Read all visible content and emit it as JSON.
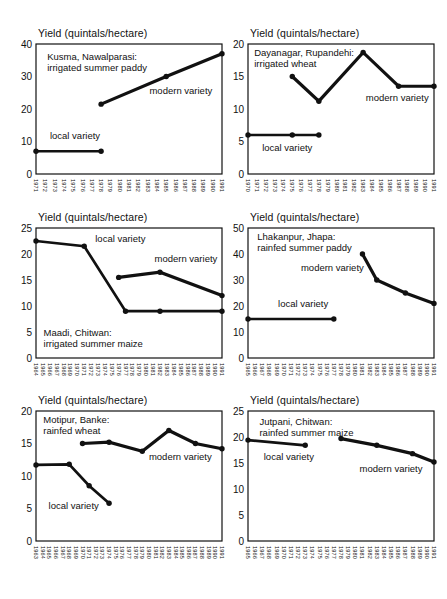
{
  "figure": {
    "background": "#ffffff",
    "ink": "#111111",
    "description_labels": {
      "local": "local variety",
      "modern": "modern variety"
    }
  },
  "chart_data": [
    {
      "type": "line",
      "title": "Yield (quintals/hectare)",
      "location_label": {
        "lines": [
          "Kusma, Nawalparasi:",
          "irrigated summer paddy"
        ],
        "x": 1972.2,
        "y": 35
      },
      "x_ticks": [
        1971,
        1972,
        1973,
        1974,
        1975,
        1976,
        1977,
        1978,
        1979,
        1980,
        1981,
        1982,
        1983,
        1984,
        1985,
        1986,
        1987,
        1988,
        1989,
        1990,
        1991
      ],
      "ylim": [
        0,
        40
      ],
      "y_ticks": [
        0,
        10,
        20,
        30,
        40
      ],
      "grid": false,
      "series": [
        {
          "name": "local variety",
          "points": [
            [
              1971,
              7
            ],
            [
              1978,
              7
            ]
          ],
          "label": {
            "text": "local variety",
            "x": 1972.5,
            "y": 10.8
          }
        },
        {
          "name": "modern variety",
          "points": [
            [
              1978,
              21.5
            ],
            [
              1985,
              30
            ],
            [
              1991,
              37
            ]
          ],
          "label": {
            "text": "modern variety",
            "x": 1983.2,
            "y": 24.5
          }
        }
      ]
    },
    {
      "type": "line",
      "title": "Yield (quintals/hectare)",
      "location_label": {
        "lines": [
          "Dayanagar, Rupandehi:",
          "irrigated wheat"
        ],
        "x": 1970.7,
        "y": 18.2
      },
      "x_ticks": [
        1970,
        1971,
        1972,
        1973,
        1974,
        1975,
        1976,
        1977,
        1978,
        1979,
        1980,
        1981,
        1982,
        1983,
        1984,
        1985,
        1986,
        1987,
        1988,
        1989,
        1990,
        1991
      ],
      "ylim": [
        0,
        20
      ],
      "y_ticks": [
        0,
        5,
        10,
        15,
        20
      ],
      "grid": false,
      "series": [
        {
          "name": "local variety",
          "points": [
            [
              1970,
              6
            ],
            [
              1975,
              6
            ],
            [
              1978,
              6
            ]
          ],
          "label": {
            "text": "local variety",
            "x": 1971.6,
            "y": 3.6
          }
        },
        {
          "name": "modern variety",
          "points": [
            [
              1975,
              15
            ],
            [
              1978,
              11.2
            ],
            [
              1983,
              18.7
            ],
            [
              1987,
              13.5
            ],
            [
              1991,
              13.5
            ]
          ],
          "label": {
            "text": "modern variety",
            "x": 1983.3,
            "y": 11.3
          }
        }
      ]
    },
    {
      "type": "line",
      "title": "Yield (quintals/hectare)",
      "location_label": {
        "lines": [
          "Maadi, Chitwan:",
          "irrigated summer maize"
        ],
        "x": 1965.1,
        "y": 4.3
      },
      "x_ticks": [
        1964,
        1965,
        1966,
        1967,
        1968,
        1969,
        1970,
        1971,
        1972,
        1973,
        1974,
        1975,
        1976,
        1977,
        1978,
        1979,
        1980,
        1981,
        1982,
        1983,
        1984,
        1985,
        1986,
        1987,
        1988,
        1989,
        1990,
        1991
      ],
      "ylim": [
        0,
        25
      ],
      "y_ticks": [
        0,
        5,
        10,
        15,
        20,
        25
      ],
      "grid": false,
      "series": [
        {
          "name": "local variety",
          "points": [
            [
              1964,
              22.5
            ],
            [
              1971,
              21.5
            ],
            [
              1977,
              9
            ],
            [
              1982,
              9
            ],
            [
              1991,
              9
            ]
          ],
          "label": {
            "text": "local variety",
            "x": 1972.6,
            "y": 22.3
          }
        },
        {
          "name": "modern variety",
          "points": [
            [
              1976,
              15.5
            ],
            [
              1982,
              16.5
            ],
            [
              1991,
              12
            ]
          ],
          "label": {
            "text": "modern variety",
            "x": 1981.2,
            "y": 18.5
          }
        }
      ]
    },
    {
      "type": "line",
      "title": "Yield (quintals/hectare)",
      "location_label": {
        "lines": [
          "Lhakanpur, Jhapa:",
          "rainfed summer paddy"
        ],
        "x": 1966.3,
        "y": 45.5
      },
      "x_ticks": [
        1965,
        1966,
        1967,
        1968,
        1969,
        1970,
        1971,
        1972,
        1973,
        1974,
        1975,
        1976,
        1977,
        1978,
        1979,
        1980,
        1981,
        1982,
        1983,
        1984,
        1985,
        1986,
        1987,
        1988,
        1989,
        1990,
        1991
      ],
      "ylim": [
        0,
        50
      ],
      "y_ticks": [
        0,
        10,
        20,
        30,
        40,
        50
      ],
      "grid": false,
      "series": [
        {
          "name": "local variety",
          "points": [
            [
              1965,
              15
            ],
            [
              1977,
              15
            ]
          ],
          "label": {
            "text": "local variety",
            "x": 1969.2,
            "y": 19.5
          }
        },
        {
          "name": "modern variety",
          "points": [
            [
              1981,
              40
            ],
            [
              1983,
              30
            ],
            [
              1987,
              25
            ],
            [
              1991,
              21
            ]
          ],
          "label": {
            "text": "modern variety",
            "x": 1972.4,
            "y": 33.5
          }
        }
      ]
    },
    {
      "type": "line",
      "title": "Yield (quintals/hectare)",
      "location_label": {
        "lines": [
          "Motipur, Banke:",
          "rainfed wheat"
        ],
        "x": 1964.1,
        "y": 18.2
      },
      "x_ticks": [
        1963,
        1964,
        1965,
        1966,
        1967,
        1968,
        1969,
        1970,
        1971,
        1972,
        1973,
        1974,
        1975,
        1976,
        1977,
        1978,
        1979,
        1980,
        1981,
        1982,
        1983,
        1984,
        1985,
        1986,
        1987,
        1988,
        1989,
        1990,
        1991
      ],
      "ylim": [
        0,
        20
      ],
      "y_ticks": [
        0,
        5,
        10,
        15,
        20
      ],
      "grid": false,
      "series": [
        {
          "name": "local variety",
          "points": [
            [
              1963,
              11.7
            ],
            [
              1968,
              11.8
            ],
            [
              1971,
              8.5
            ],
            [
              1974,
              5.8
            ]
          ],
          "label": {
            "text": "local variety",
            "x": 1964.9,
            "y": 5.0
          }
        },
        {
          "name": "modern variety",
          "points": [
            [
              1970,
              15
            ],
            [
              1974,
              15.2
            ],
            [
              1979,
              13.8
            ],
            [
              1983,
              17
            ],
            [
              1987,
              15
            ],
            [
              1991,
              14.2
            ]
          ],
          "label": {
            "text": "modern variety",
            "x": 1980.0,
            "y": 12.5
          }
        }
      ]
    },
    {
      "type": "line",
      "title": "Yield (quintals/hectare)",
      "location_label": {
        "lines": [
          "Jutpani, Chitwan:",
          "rainfed summer maize"
        ],
        "x": 1966.6,
        "y": 22.3
      },
      "x_ticks": [
        1965,
        1966,
        1967,
        1968,
        1969,
        1970,
        1971,
        1972,
        1973,
        1974,
        1975,
        1976,
        1977,
        1978,
        1979,
        1980,
        1981,
        1982,
        1983,
        1984,
        1985,
        1986,
        1987,
        1988,
        1989,
        1990,
        1991
      ],
      "ylim": [
        0,
        25
      ],
      "y_ticks": [
        0,
        5,
        10,
        15,
        20,
        25
      ],
      "grid": false,
      "series": [
        {
          "name": "local variety",
          "points": [
            [
              1965,
              19.4
            ],
            [
              1973,
              18.4
            ]
          ],
          "label": {
            "text": "local variety",
            "x": 1967.2,
            "y": 15.6
          }
        },
        {
          "name": "modern variety",
          "points": [
            [
              1978,
              19.7
            ],
            [
              1983,
              18.4
            ],
            [
              1988,
              16.8
            ],
            [
              1991,
              15.2
            ]
          ],
          "label": {
            "text": "modern variety",
            "x": 1980.6,
            "y": 13.2
          }
        }
      ]
    }
  ]
}
